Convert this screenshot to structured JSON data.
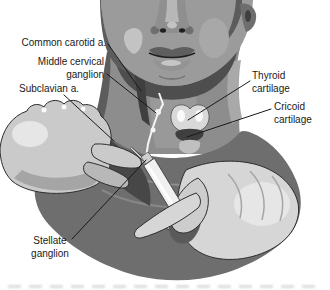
{
  "labels": {
    "common_carotid": "Common carotid a.",
    "middle_cervical_ganglion": "Middle cervical\nganglion",
    "subclavian": "Subclavian a.",
    "stellate_ganglion": "Stellate\nganglion",
    "thyroid_cartilage": "Thyroid\ncartilage",
    "cricoid_cartilage": "Cricoid\ncartilage"
  },
  "palette": {
    "background": "#ffffff",
    "ink": "#1a1a1a",
    "outline": "#2e2e2e",
    "torso": "#6e6e6e",
    "jaw_shadow": "#4e4e4e",
    "neck": "#8d8d8d",
    "throat": "#999999",
    "face": "#9b9b9b",
    "face_shadow": "#5c5c5c",
    "deep_shadow": "#3f3f3f",
    "shadow_mid": "#474747",
    "highlight": "#c3c3c3",
    "bright": "#e9e9e9",
    "white": "#ffffff",
    "hand": "#cacaca",
    "hand_right": "#d6d6d6",
    "hand_shadow": "#a5a5a5",
    "finger_shade": "#b8b8b8",
    "thumb": "#cdcdcd",
    "grip_gap": "#5a5a5a",
    "muscle": "#a9a9a9",
    "cheek": "#a8a8a8",
    "nose": "#8f8f8f",
    "nose_bridge": "#b7b7b7",
    "nose_wing": "#6f6f6f",
    "nostril": "#1f1f1f",
    "lip": "#5e5e5e",
    "lip_lower": "#949494",
    "lip_shine": "#c6c6c6",
    "cartilage": "#d9d9d9",
    "cartilage_shade": "#bfbfbf",
    "chain": "#f5f5f5",
    "syringe": "#f0f0f0",
    "metal": "#cfcfcf",
    "flange": "#e3e3e3"
  }
}
